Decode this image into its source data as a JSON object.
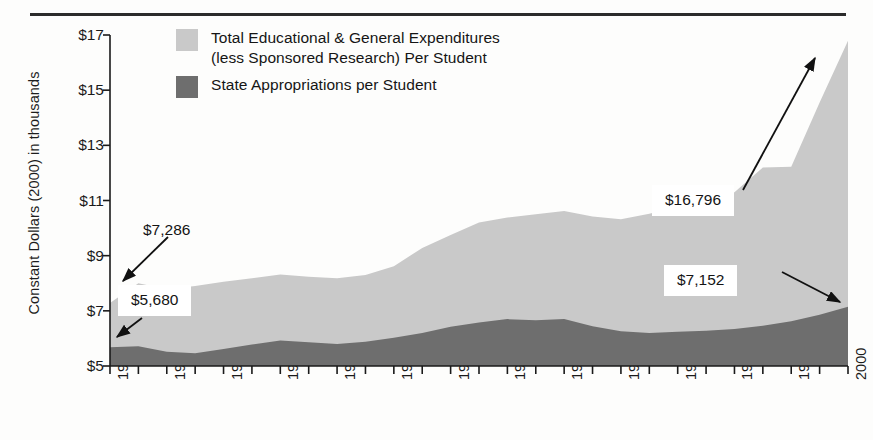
{
  "chart_data": {
    "type": "area",
    "stacked": false,
    "title": "",
    "xlabel": "",
    "ylabel": "Constant Dollars (2000) in thousands",
    "x": [
      1974,
      1975,
      1976,
      1977,
      1978,
      1979,
      1980,
      1981,
      1982,
      1983,
      1984,
      1985,
      1986,
      1987,
      1988,
      1989,
      1990,
      1991,
      1992,
      1993,
      1994,
      1995,
      1996,
      1997,
      1998,
      1999,
      2000
    ],
    "xlim": [
      1974,
      2000
    ],
    "ylim": [
      5,
      17
    ],
    "ytick_values": [
      17,
      15,
      13,
      11,
      9,
      7,
      5
    ],
    "ytick_labels": [
      "$17",
      "$15",
      "$13",
      "$11",
      "$9",
      "$7",
      "$5"
    ],
    "xtick_values": [
      1974,
      1976,
      1978,
      1980,
      1982,
      1984,
      1986,
      1988,
      1990,
      1992,
      1994,
      1996,
      1998,
      2000
    ],
    "xtick_labels": [
      "1974",
      "1976",
      "1978",
      "1980",
      "1982",
      "1984",
      "1986",
      "1988",
      "1990",
      "1992",
      "1994",
      "1996",
      "1998",
      "2000"
    ],
    "grid": false,
    "legend_position": "top-left",
    "series": [
      {
        "name": "Total Educational & General Expenditures\n(less Sponsored Research) Per Student",
        "color": "#c9c9c9",
        "values": [
          7.286,
          8.0,
          7.78,
          7.9,
          8.05,
          8.18,
          8.32,
          8.24,
          8.18,
          8.3,
          8.62,
          9.28,
          9.75,
          10.2,
          10.38,
          10.5,
          10.62,
          10.42,
          10.32,
          10.52,
          10.78,
          11.0,
          11.3,
          12.2,
          12.22,
          14.55,
          16.796
        ]
      },
      {
        "name": "State Appropriations per Student",
        "color": "#6e6e6e",
        "values": [
          5.68,
          5.72,
          5.52,
          5.46,
          5.62,
          5.78,
          5.92,
          5.86,
          5.8,
          5.88,
          6.02,
          6.2,
          6.42,
          6.58,
          6.7,
          6.66,
          6.7,
          6.44,
          6.26,
          6.2,
          6.24,
          6.28,
          6.34,
          6.46,
          6.62,
          6.86,
          7.152
        ]
      }
    ],
    "annotations": [
      {
        "id": "a1",
        "label": "$7,286",
        "style": "plain",
        "anchor_year": 1974,
        "anchor_value": 7.286
      },
      {
        "id": "a2",
        "label": "$5,680",
        "style": "boxed",
        "anchor_year": 1974,
        "anchor_value": 5.68
      },
      {
        "id": "a3",
        "label": "$16,796",
        "style": "boxed",
        "anchor_year": 2000,
        "anchor_value": 16.796
      },
      {
        "id": "a4",
        "label": "$7,152",
        "style": "boxed",
        "anchor_year": 2000,
        "anchor_value": 7.152
      }
    ]
  },
  "legend": {
    "items": [
      {
        "label": "Total Educational & General Expenditures\n(less Sponsored Research) Per Student",
        "color": "#c9c9c9"
      },
      {
        "label": "State Appropriations per Student",
        "color": "#6e6e6e"
      }
    ]
  },
  "axis": {
    "y_title": "Constant Dollars (2000) in thousands"
  },
  "colors": {
    "total_expenditures": "#c9c9c9",
    "state_appropriations": "#6e6e6e",
    "axis": "#1a1a1a",
    "rule": "#2b2b2b",
    "callout_background": "#ffffff"
  }
}
